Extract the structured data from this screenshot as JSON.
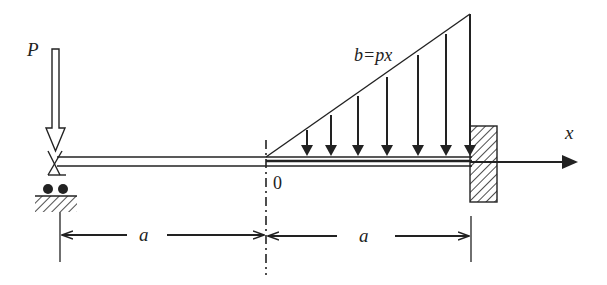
{
  "diagram": {
    "type": "beam-loading",
    "labels": {
      "point_load": "P",
      "distributed_load": "b=px",
      "x_axis": "x",
      "origin": "0",
      "span_left": "a",
      "span_right": "a"
    },
    "elements": {
      "point_load": {
        "symbol": "P",
        "position": "left end, over roller support"
      },
      "left_support": "roller (pin with two wheels on hatched ground)",
      "beam_left_segment": "from left support to origin 0, length a",
      "beam_right_segment": "from origin 0 to fixed wall, length a, with linearly increasing load b=px",
      "right_support": "fixed wall (hatched)",
      "distributed_load_arrows": 7
    },
    "colors": {
      "ink": "#222222",
      "background": "#ffffff"
    }
  }
}
